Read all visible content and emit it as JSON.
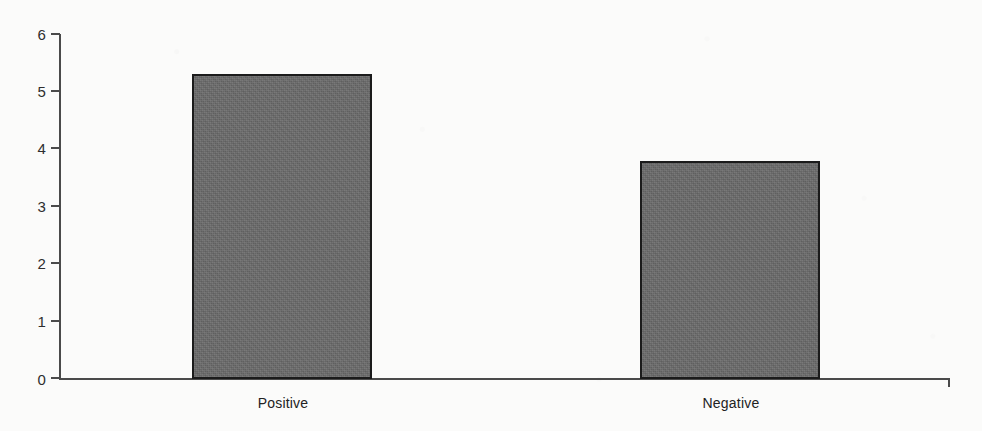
{
  "chart_data": {
    "type": "bar",
    "title": "",
    "subtitle": "",
    "xlabel": "",
    "ylabel": "",
    "categories": [
      "Positive",
      "Negative"
    ],
    "values": [
      5.3,
      3.8
    ],
    "series": [
      {
        "name": "",
        "values": [
          5.3,
          3.8
        ]
      }
    ],
    "ylim": [
      0,
      6
    ],
    "yticks": [
      0,
      1,
      2,
      3,
      4,
      5,
      6
    ],
    "ytick_labels": [
      "0",
      "1",
      "2",
      "3",
      "4",
      "5",
      "6"
    ],
    "grid": false,
    "legend": false,
    "legend_position": "none",
    "annotations": [],
    "colors": {
      "bar_fill": "#6a6a6a",
      "bar_border": "#1b1b1b",
      "axis": "#4a4a4a",
      "tick_text": "#2e2e2e",
      "category_text": "#222222",
      "background": "#fbfbfa"
    }
  },
  "axis": {
    "y_tick_0": "0",
    "y_tick_1": "1",
    "y_tick_2": "2",
    "y_tick_3": "3",
    "y_tick_4": "4",
    "y_tick_5": "5",
    "y_tick_6": "6"
  },
  "categories": {
    "positive_label": "Positive",
    "negative_label": "Negative"
  }
}
